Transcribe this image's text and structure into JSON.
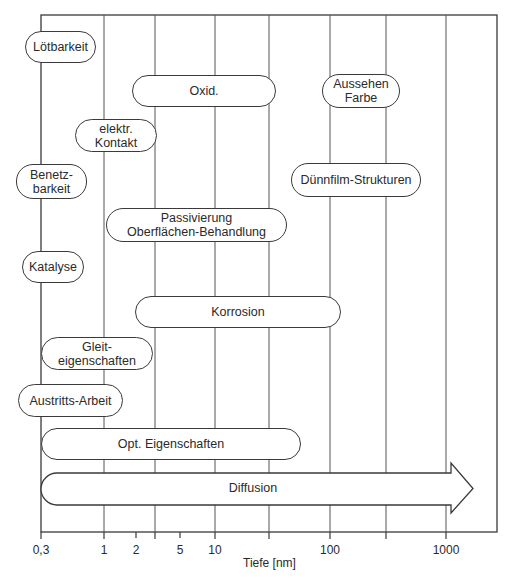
{
  "diagram": {
    "axis": {
      "title": "Tiefe [nm]",
      "scale": "log",
      "tick_labels": [
        "0,3",
        "1",
        "2",
        "5",
        "10",
        "100",
        "1000"
      ],
      "gridlines_at": [
        1,
        3,
        10,
        30,
        100,
        300,
        1000
      ]
    },
    "properties": [
      {
        "id": "loetbarkeit",
        "lines": [
          "Lötbarkeit"
        ]
      },
      {
        "id": "oxid",
        "lines": [
          "Oxid."
        ]
      },
      {
        "id": "aussehen",
        "lines": [
          "Aussehen",
          "Farbe"
        ]
      },
      {
        "id": "kontakt",
        "lines": [
          "elektr.",
          "Kontakt"
        ]
      },
      {
        "id": "benetzbarkeit",
        "lines": [
          "Benetz-",
          "barkeit"
        ]
      },
      {
        "id": "duennfilm",
        "lines": [
          "Dünnfilm-Strukturen"
        ]
      },
      {
        "id": "passivierung",
        "lines": [
          "Passivierung",
          "Oberflächen-Behandlung"
        ]
      },
      {
        "id": "katalyse",
        "lines": [
          "Katalyse"
        ]
      },
      {
        "id": "korrosion",
        "lines": [
          "Korrosion"
        ]
      },
      {
        "id": "gleit",
        "lines": [
          "Gleit-",
          "eigenschaften"
        ]
      },
      {
        "id": "austritt",
        "lines": [
          "Austritts-Arbeit"
        ]
      },
      {
        "id": "optik",
        "lines": [
          "Opt. Eigenschaften"
        ]
      }
    ],
    "arrow": {
      "label": "Diffusion"
    }
  }
}
